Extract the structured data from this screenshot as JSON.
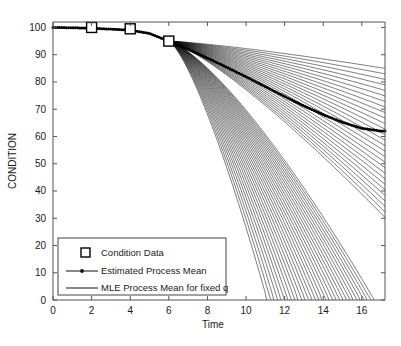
{
  "chart_data": {
    "type": "line",
    "title": "",
    "xlabel": "Time",
    "ylabel": "CONDITION",
    "xlim": [
      0,
      17.2
    ],
    "ylim": [
      0,
      102
    ],
    "xticks": [
      0,
      2,
      4,
      6,
      8,
      10,
      12,
      14,
      16
    ],
    "yticks": [
      0,
      10,
      20,
      30,
      40,
      50,
      60,
      70,
      80,
      90,
      100
    ],
    "xtick_labels": [
      "0",
      "2",
      "4",
      "6",
      "8",
      "10",
      "12",
      "14",
      "16"
    ],
    "ytick_labels": [
      "0",
      "10",
      "20",
      "30",
      "40",
      "50",
      "60",
      "70",
      "80",
      "90",
      "100"
    ],
    "grid": false,
    "legend_position": "lower left",
    "series": [
      {
        "name": "Condition Data",
        "marker": "square",
        "style": "markers",
        "x": [
          2,
          4,
          6
        ],
        "y": [
          100,
          99.5,
          95
        ]
      },
      {
        "name": "Estimated Process Mean",
        "marker": "dot",
        "style": "line-with-markers",
        "x": [
          0,
          1,
          2,
          3,
          4,
          5,
          6,
          7,
          8,
          9,
          10,
          11,
          12,
          13,
          14,
          15,
          16,
          17
        ],
        "y": [
          100,
          99.9,
          99.7,
          99.4,
          99.0,
          97.8,
          95.0,
          92.0,
          88.8,
          85.4,
          81.9,
          78.3,
          74.7,
          71.2,
          68.0,
          65.2,
          63.0,
          62.0
        ]
      },
      {
        "name": "MLE Process Mean for fixed q",
        "style": "line-family",
        "description": "Family of MLE curves fanning out from the last condition observation at (6, 95); fastest curves reach zero near t=11 and the slowest remain near 85 at t=17.",
        "fan_origin": [
          6,
          95
        ],
        "count": 60,
        "endpoints_at_t17": [
          85,
          84,
          83,
          82,
          80,
          79,
          77,
          75,
          73,
          71,
          68,
          66,
          63,
          60,
          57,
          54,
          50,
          46,
          42,
          38,
          33,
          28,
          23,
          18,
          12,
          6,
          0
        ],
        "zero_crossings": [
          11.1,
          11.3,
          11.5,
          11.8,
          12.1,
          12.4,
          12.8,
          13.2,
          13.7,
          14.2,
          14.8,
          15.4,
          16.1,
          16.8
        ]
      }
    ]
  },
  "axes": {
    "ylabel": "CONDITION",
    "xlabel": "Time"
  },
  "legend": {
    "items": [
      {
        "label": "Condition Data",
        "glyph": "square-marker"
      },
      {
        "label": "Estimated Process Mean",
        "glyph": "line-dot-marker"
      },
      {
        "label": "MLE Process Mean for fixed q",
        "glyph": "plain-line"
      }
    ]
  },
  "colors": {
    "line": "#111111",
    "frame": "#555555",
    "background": "#ffffff"
  }
}
